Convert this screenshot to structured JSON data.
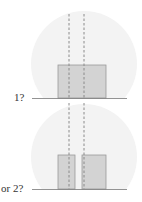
{
  "panels": [
    {
      "label": "1?",
      "blocks": 1
    },
    {
      "label": "or 2?",
      "blocks": 2
    }
  ],
  "colors": {
    "background_disc": "#f3f3f3",
    "block_fill": "#d3d3d3",
    "block_stroke": "#9a9a9a",
    "dashed_line": "#8a8a8a",
    "baseline": "#777777",
    "label": "#333333"
  }
}
